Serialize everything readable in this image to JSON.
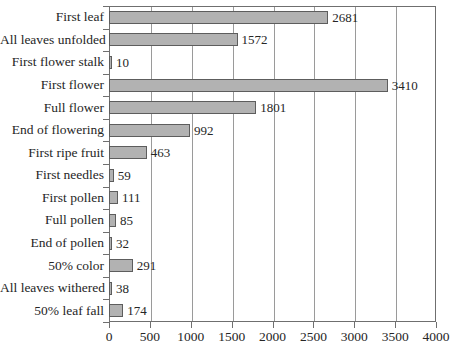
{
  "chart_data": {
    "type": "bar",
    "orientation": "horizontal",
    "title": "",
    "subtitle": "",
    "xlabel": "",
    "ylabel": "",
    "xlim": [
      0,
      4000
    ],
    "xticks": [
      0,
      500,
      1000,
      1500,
      2000,
      2500,
      3000,
      3500,
      4000
    ],
    "xtick_labels": [
      "0",
      "500",
      "1000",
      "1500",
      "2000",
      "2500",
      "3000",
      "3500",
      "4000"
    ],
    "grid": "vertical",
    "legend": "none",
    "bar_color": "#b2b2b2",
    "bar_edge_color": "#5d5d5d",
    "axis_color": "#6f6f6f",
    "gridline_color": "#9a9a9a",
    "show_data_labels": true,
    "categories": [
      "First leaf",
      "All leaves unfolded",
      "First flower stalk",
      "First flower",
      "Full flower",
      "End of flowering",
      "First ripe fruit",
      "First needles",
      "First pollen",
      "Full pollen",
      "End of pollen",
      "50% color",
      "All leaves withered",
      "50% leaf fall"
    ],
    "values": [
      2681,
      1572,
      10,
      3410,
      1801,
      992,
      463,
      59,
      111,
      85,
      32,
      291,
      38,
      174
    ],
    "value_labels": [
      "2681",
      "1572",
      "10",
      "3410",
      "1801",
      "992",
      "463",
      "59",
      "111",
      "85",
      "32",
      "291",
      "38",
      "174"
    ]
  }
}
